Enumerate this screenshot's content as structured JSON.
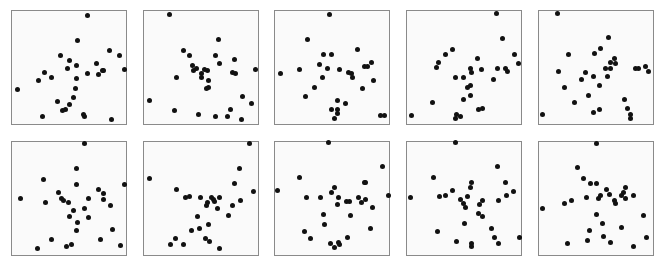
{
  "chart_data": {
    "type": "scatter",
    "title": "",
    "layout": {
      "rows": 2,
      "cols": 5,
      "grid": false,
      "axes_ticks": false,
      "legend": false,
      "panel_origins_x": [
        11,
        143,
        274,
        406,
        538
      ],
      "panel_origins_y": [
        10,
        141
      ],
      "panel_width": 116,
      "panel_height": 115,
      "dot_color": "#111111",
      "frame_color": "#8a8a8a"
    },
    "panels": [
      {
        "row": 0,
        "col": 0,
        "points": [
          [
            75,
            4
          ],
          [
            65,
            29
          ],
          [
            97,
            39
          ],
          [
            107,
            44
          ],
          [
            48,
            44
          ],
          [
            57,
            49
          ],
          [
            84,
            52
          ],
          [
            64,
            54
          ],
          [
            55,
            57
          ],
          [
            112,
            58
          ],
          [
            90,
            59
          ],
          [
            91,
            59
          ],
          [
            32,
            61
          ],
          [
            75,
            62
          ],
          [
            86,
            63
          ],
          [
            39,
            66
          ],
          [
            64,
            67
          ],
          [
            26,
            69
          ],
          [
            5,
            78
          ],
          [
            63,
            77
          ],
          [
            61,
            86
          ],
          [
            45,
            90
          ],
          [
            57,
            93
          ],
          [
            53,
            98
          ],
          [
            50,
            99
          ],
          [
            71,
            103
          ],
          [
            72,
            105
          ],
          [
            30,
            105
          ],
          [
            99,
            108
          ]
        ]
      },
      {
        "row": 0,
        "col": 1,
        "points": [
          [
            25,
            3
          ],
          [
            74,
            28
          ],
          [
            39,
            39
          ],
          [
            45,
            44
          ],
          [
            71,
            44
          ],
          [
            75,
            52
          ],
          [
            90,
            48
          ],
          [
            48,
            54
          ],
          [
            52,
            57
          ],
          [
            49,
            59
          ],
          [
            60,
            58
          ],
          [
            63,
            59
          ],
          [
            111,
            58
          ],
          [
            88,
            61
          ],
          [
            91,
            62
          ],
          [
            57,
            62
          ],
          [
            57,
            66
          ],
          [
            32,
            66
          ],
          [
            64,
            69
          ],
          [
            64,
            76
          ],
          [
            62,
            77
          ],
          [
            5,
            89
          ],
          [
            98,
            85
          ],
          [
            107,
            92
          ],
          [
            30,
            99
          ],
          [
            86,
            98
          ],
          [
            54,
            103
          ],
          [
            71,
            105
          ],
          [
            83,
            105
          ],
          [
            97,
            108
          ]
        ]
      },
      {
        "row": 0,
        "col": 2,
        "points": [
          [
            54,
            3
          ],
          [
            32,
            28
          ],
          [
            48,
            43
          ],
          [
            56,
            43
          ],
          [
            82,
            38
          ],
          [
            44,
            53
          ],
          [
            52,
            57
          ],
          [
            64,
            58
          ],
          [
            96,
            51
          ],
          [
            89,
            55
          ],
          [
            92,
            55
          ],
          [
            73,
            61
          ],
          [
            76,
            62
          ],
          [
            77,
            66
          ],
          [
            47,
            66
          ],
          [
            24,
            58
          ],
          [
            5,
            62
          ],
          [
            39,
            76
          ],
          [
            30,
            85
          ],
          [
            62,
            89
          ],
          [
            70,
            92
          ],
          [
            56,
            98
          ],
          [
            62,
            98
          ],
          [
            62,
            102
          ],
          [
            59,
            107
          ],
          [
            87,
            77
          ],
          [
            98,
            69
          ],
          [
            105,
            104
          ],
          [
            109,
            104
          ]
        ]
      },
      {
        "row": 0,
        "col": 3,
        "points": [
          [
            89,
            2
          ],
          [
            95,
            27
          ],
          [
            45,
            38
          ],
          [
            38,
            43
          ],
          [
            31,
            51
          ],
          [
            29,
            56
          ],
          [
            107,
            43
          ],
          [
            111,
            52
          ],
          [
            70,
            47
          ],
          [
            63,
            57
          ],
          [
            64,
            61
          ],
          [
            74,
            58
          ],
          [
            90,
            57
          ],
          [
            98,
            57
          ],
          [
            100,
            60
          ],
          [
            48,
            66
          ],
          [
            56,
            66
          ],
          [
            86,
            68
          ],
          [
            63,
            74
          ],
          [
            60,
            76
          ],
          [
            63,
            84
          ],
          [
            56,
            88
          ],
          [
            25,
            91
          ],
          [
            4,
            104
          ],
          [
            71,
            98
          ],
          [
            75,
            97
          ],
          [
            53,
            105
          ],
          [
            49,
            103
          ],
          [
            48,
            107
          ]
        ]
      },
      {
        "row": 0,
        "col": 4,
        "points": [
          [
            18,
            2
          ],
          [
            69,
            26
          ],
          [
            29,
            43
          ],
          [
            55,
            42
          ],
          [
            61,
            37
          ],
          [
            75,
            47
          ],
          [
            71,
            51
          ],
          [
            76,
            52
          ],
          [
            66,
            57
          ],
          [
            71,
            57
          ],
          [
            19,
            60
          ],
          [
            46,
            61
          ],
          [
            54,
            65
          ],
          [
            68,
            65
          ],
          [
            42,
            68
          ],
          [
            96,
            57
          ],
          [
            99,
            57
          ],
          [
            106,
            55
          ],
          [
            109,
            60
          ],
          [
            60,
            74
          ],
          [
            25,
            76
          ],
          [
            49,
            84
          ],
          [
            35,
            91
          ],
          [
            85,
            88
          ],
          [
            88,
            97
          ],
          [
            91,
            103
          ],
          [
            91,
            107
          ],
          [
            54,
            101
          ],
          [
            60,
            98
          ],
          [
            3,
            103
          ]
        ]
      },
      {
        "row": 1,
        "col": 0,
        "points": [
          [
            72,
            1
          ],
          [
            64,
            26
          ],
          [
            31,
            37
          ],
          [
            64,
            42
          ],
          [
            46,
            50
          ],
          [
            49,
            56
          ],
          [
            51,
            58
          ],
          [
            56,
            60
          ],
          [
            112,
            42
          ],
          [
            86,
            47
          ],
          [
            91,
            51
          ],
          [
            91,
            57
          ],
          [
            98,
            63
          ],
          [
            76,
            56
          ],
          [
            72,
            66
          ],
          [
            61,
            68
          ],
          [
            57,
            74
          ],
          [
            76,
            75
          ],
          [
            65,
            80
          ],
          [
            64,
            88
          ],
          [
            8,
            56
          ],
          [
            33,
            60
          ],
          [
            39,
            97
          ],
          [
            25,
            106
          ],
          [
            54,
            104
          ],
          [
            59,
            102
          ],
          [
            88,
            97
          ],
          [
            100,
            87
          ],
          [
            108,
            103
          ]
        ]
      },
      {
        "row": 1,
        "col": 1,
        "points": [
          [
            105,
            1
          ],
          [
            95,
            26
          ],
          [
            90,
            41
          ],
          [
            109,
            49
          ],
          [
            5,
            36
          ],
          [
            32,
            47
          ],
          [
            75,
            55
          ],
          [
            41,
            55
          ],
          [
            45,
            54
          ],
          [
            56,
            55
          ],
          [
            67,
            55
          ],
          [
            63,
            60
          ],
          [
            62,
            63
          ],
          [
            69,
            57
          ],
          [
            70,
            59
          ],
          [
            73,
            66
          ],
          [
            88,
            63
          ],
          [
            84,
            73
          ],
          [
            96,
            58
          ],
          [
            53,
            74
          ],
          [
            64,
            82
          ],
          [
            47,
            88
          ],
          [
            55,
            86
          ],
          [
            61,
            96
          ],
          [
            65,
            99
          ],
          [
            31,
            96
          ],
          [
            26,
            102
          ],
          [
            39,
            102
          ],
          [
            75,
            106
          ]
        ]
      },
      {
        "row": 1,
        "col": 2,
        "points": [
          [
            53,
            0
          ],
          [
            107,
            24
          ],
          [
            24,
            35
          ],
          [
            89,
            40
          ],
          [
            90,
            40
          ],
          [
            2,
            48
          ],
          [
            59,
            45
          ],
          [
            56,
            50
          ],
          [
            31,
            55
          ],
          [
            45,
            55
          ],
          [
            63,
            55
          ],
          [
            62,
            62
          ],
          [
            71,
            59
          ],
          [
            74,
            59
          ],
          [
            83,
            55
          ],
          [
            86,
            60
          ],
          [
            90,
            57
          ],
          [
            97,
            65
          ],
          [
            113,
            53
          ],
          [
            75,
            73
          ],
          [
            48,
            72
          ],
          [
            49,
            82
          ],
          [
            29,
            89
          ],
          [
            35,
            96
          ],
          [
            72,
            95
          ],
          [
            95,
            86
          ],
          [
            55,
            101
          ],
          [
            59,
            105
          ],
          [
            63,
            100
          ],
          [
            64,
            102
          ]
        ]
      },
      {
        "row": 1,
        "col": 3,
        "points": [
          [
            48,
            0
          ],
          [
            90,
            24
          ],
          [
            26,
            35
          ],
          [
            98,
            40
          ],
          [
            64,
            40
          ],
          [
            63,
            45
          ],
          [
            45,
            48
          ],
          [
            38,
            53
          ],
          [
            32,
            54
          ],
          [
            60,
            54
          ],
          [
            106,
            49
          ],
          [
            99,
            53
          ],
          [
            91,
            58
          ],
          [
            53,
            57
          ],
          [
            56,
            61
          ],
          [
            58,
            65
          ],
          [
            75,
            58
          ],
          [
            72,
            62
          ],
          [
            71,
            71
          ],
          [
            75,
            74
          ],
          [
            3,
            55
          ],
          [
            57,
            81
          ],
          [
            30,
            89
          ],
          [
            84,
            86
          ],
          [
            87,
            95
          ],
          [
            91,
            101
          ],
          [
            112,
            95
          ],
          [
            49,
            99
          ],
          [
            64,
            101
          ],
          [
            64,
            104
          ]
        ]
      },
      {
        "row": 1,
        "col": 4,
        "points": [
          [
            57,
            1
          ],
          [
            38,
            25
          ],
          [
            44,
            36
          ],
          [
            51,
            41
          ],
          [
            57,
            41
          ],
          [
            67,
            47
          ],
          [
            86,
            45
          ],
          [
            84,
            50
          ],
          [
            82,
            53
          ],
          [
            94,
            53
          ],
          [
            86,
            56
          ],
          [
            70,
            52
          ],
          [
            61,
            53
          ],
          [
            59,
            56
          ],
          [
            75,
            58
          ],
          [
            76,
            61
          ],
          [
            47,
            55
          ],
          [
            32,
            58
          ],
          [
            25,
            61
          ],
          [
            3,
            66
          ],
          [
            104,
            73
          ],
          [
            57,
            72
          ],
          [
            63,
            81
          ],
          [
            82,
            85
          ],
          [
            50,
            88
          ],
          [
            64,
            94
          ],
          [
            107,
            95
          ],
          [
            28,
            101
          ],
          [
            48,
            98
          ],
          [
            71,
            100
          ],
          [
            94,
            104
          ]
        ]
      }
    ]
  }
}
